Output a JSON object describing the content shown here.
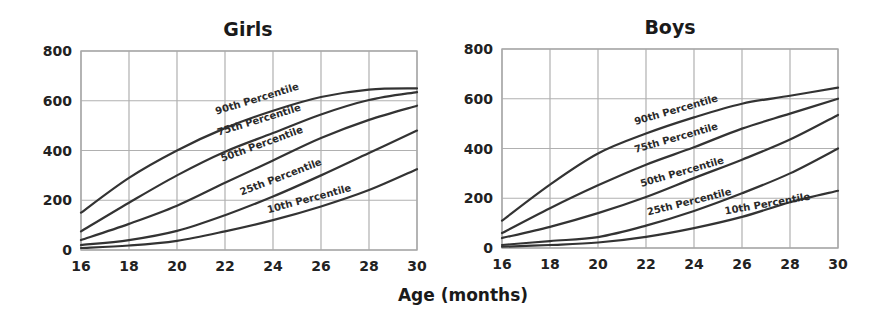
{
  "chart_data": [
    {
      "type": "line",
      "title": "Girls",
      "xlabel": "Age (months)",
      "ylabel": "",
      "x": [
        16,
        18,
        20,
        22,
        24,
        26,
        28,
        30
      ],
      "xticks": [
        "16",
        "18",
        "20",
        "22",
        "24",
        "26",
        "28",
        "30"
      ],
      "yticks": [
        "0",
        "200",
        "400",
        "600",
        "800"
      ],
      "xlim": [
        16,
        30
      ],
      "ylim": [
        0,
        800
      ],
      "grid": true,
      "legend": "inline labels on curves",
      "series": [
        {
          "name": "90th Percentile",
          "values": [
            150,
            290,
            400,
            490,
            560,
            615,
            645,
            650
          ]
        },
        {
          "name": "75th Percentile",
          "values": [
            75,
            190,
            300,
            395,
            470,
            545,
            603,
            635
          ]
        },
        {
          "name": "50th Percentile",
          "values": [
            40,
            105,
            178,
            270,
            360,
            450,
            523,
            580
          ]
        },
        {
          "name": "25th Percentile",
          "values": [
            20,
            40,
            77,
            140,
            215,
            300,
            390,
            480
          ]
        },
        {
          "name": "10th Percentile",
          "values": [
            8,
            18,
            37,
            75,
            120,
            175,
            241,
            325
          ]
        }
      ]
    },
    {
      "type": "line",
      "title": "Boys",
      "xlabel": "Age (months)",
      "ylabel": "",
      "x": [
        16,
        18,
        20,
        22,
        24,
        26,
        28,
        30
      ],
      "xticks": [
        "16",
        "18",
        "20",
        "22",
        "24",
        "26",
        "28",
        "30"
      ],
      "yticks": [
        "0",
        "200",
        "400",
        "600",
        "800"
      ],
      "xlim": [
        16,
        30
      ],
      "ylim": [
        0,
        800
      ],
      "grid": true,
      "legend": "inline labels on curves",
      "series": [
        {
          "name": "90th Percentile",
          "values": [
            110,
            255,
            380,
            460,
            525,
            580,
            612,
            645
          ]
        },
        {
          "name": "75th Percentile",
          "values": [
            60,
            160,
            252,
            335,
            405,
            480,
            540,
            600
          ]
        },
        {
          "name": "50th Percentile",
          "values": [
            40,
            85,
            140,
            205,
            281,
            355,
            436,
            535
          ]
        },
        {
          "name": "25th Percentile",
          "values": [
            12,
            28,
            44,
            90,
            149,
            220,
            300,
            400
          ]
        },
        {
          "name": "10th Percentile",
          "values": [
            5,
            12,
            22,
            45,
            80,
            125,
            184,
            230
          ]
        }
      ]
    }
  ],
  "shared_xlabel": "Age (months)",
  "label_layout": {
    "girls": [
      {
        "cx": 258,
        "cy": 102,
        "angle": -17
      },
      {
        "cx": 260,
        "cy": 123,
        "angle": -17
      },
      {
        "cx": 263,
        "cy": 147,
        "angle": -20
      },
      {
        "cx": 282,
        "cy": 180,
        "angle": -21
      },
      {
        "cx": 310,
        "cy": 202,
        "angle": -15
      }
    ],
    "boys": [
      {
        "cx": 677,
        "cy": 113,
        "angle": -16
      },
      {
        "cx": 677,
        "cy": 141,
        "angle": -16
      },
      {
        "cx": 683,
        "cy": 175,
        "angle": -16
      },
      {
        "cx": 690,
        "cy": 205,
        "angle": -14
      },
      {
        "cx": 768,
        "cy": 207,
        "angle": -10
      }
    ]
  }
}
